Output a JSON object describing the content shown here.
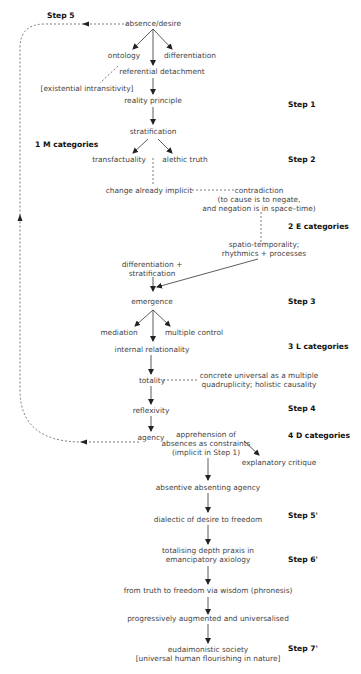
{
  "diagram": {
    "step_labels": {
      "step5": "Step 5",
      "step1": "Step 1",
      "m_categories": "1 M categories",
      "step2": "Step 2",
      "e_categories": "2 E categories",
      "step3": "Step 3",
      "l_categories": "3 L categories",
      "step4": "Step 4",
      "d_categories": "4 D categories",
      "step5p": "Step 5'",
      "step6p": "Step 6'",
      "step7p": "Step 7'"
    },
    "nodes": {
      "absence_desire": "absence/desire",
      "ontology": "ontology",
      "differentiation": "differentiation",
      "referential_detachment": "referential detachment",
      "existential_intransitivity": "[existential intransitivity]",
      "reality_principle": "reality principle",
      "stratification": "stratification",
      "transfactuality": "transfactuality",
      "alethic_truth": "alethic truth",
      "change_already_implicit": "change already implicit",
      "contradiction": "contradiction",
      "contradiction_note_1": "(to cause is to negate,",
      "contradiction_note_2": "and negation is in space–time)",
      "spatio_temporality_1": "spatio-temporality;",
      "spatio_temporality_2": "rhythmics + processes",
      "diff_strat_1": "differentiation +",
      "diff_strat_2": "stratification",
      "emergence": "emergence",
      "mediation": "mediation",
      "multiple_control": "multiple control",
      "internal_relationality": "internal relationality",
      "totality": "totality",
      "concrete_universal_1": "concrete universal as a multiple",
      "concrete_universal_2": "quadruplicity; holistic causality",
      "reflexivity": "reflexivity",
      "agency": "agency",
      "apprehension_1": "apprehension of",
      "apprehension_2": "absences as constraints",
      "apprehension_3": "(implicit in Step 1)",
      "explanatory_critique": "explanatory critique",
      "absentive_absenting_agency": "absentive absenting agency",
      "dialectic": "dialectic of desire to freedom",
      "totalising_1": "totalising depth praxis in",
      "totalising_2": "emancipatory axiology",
      "truth_to_freedom": "from truth to freedom via wisdom (phronesis)",
      "progressively": "progressively augmented and universalised",
      "eudaimonistic_1": "eudaimonistic society",
      "eudaimonistic_2": "[universal human flourishing in nature]"
    },
    "colors": {
      "line": "#333333",
      "text": "#444444",
      "label": "#111111"
    }
  }
}
